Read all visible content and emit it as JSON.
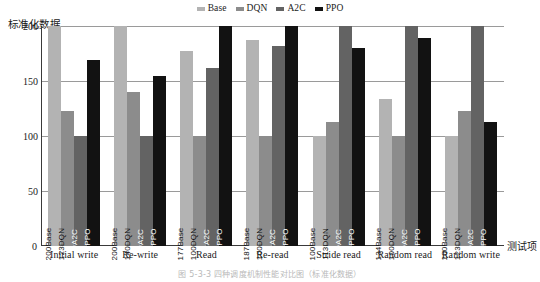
{
  "chart_data": {
    "type": "bar",
    "title": "",
    "xlabel": "测试项",
    "ylabel": "标准化数据",
    "ylim": [
      0,
      200
    ],
    "yticks": [
      0,
      50,
      100,
      150,
      200
    ],
    "grid": true,
    "legend_position": "top-center",
    "categories": [
      "Initial write",
      "Re-write",
      "Read",
      "Re-read",
      "Stride read",
      "Random read",
      "Random write"
    ],
    "series": [
      {
        "name": "Base",
        "color": "#b3b3b3",
        "values": [
          200,
          200,
          177,
          187,
          100,
          134,
          100
        ]
      },
      {
        "name": "DQN",
        "color": "#8c8c8c",
        "values": [
          123,
          140,
          100,
          100,
          113,
          100,
          123
        ]
      },
      {
        "name": "A2C",
        "color": "#636363",
        "values": [
          100,
          100,
          162,
          182,
          200,
          200,
          200
        ]
      },
      {
        "name": "PPO",
        "color": "#121212",
        "values": [
          169,
          155,
          200,
          200,
          180,
          189,
          113
        ]
      }
    ],
    "bar_labels": [
      [
        "200Base",
        "123DQN",
        "100A2C",
        "169PPO"
      ],
      [
        "200Base",
        "140DQN",
        "100A2C",
        "155PPO"
      ],
      [
        "177Base",
        "100DQN",
        "162A2C",
        "200PPO"
      ],
      [
        "187Base",
        "100DQN",
        "182A2C",
        "200PPO"
      ],
      [
        "100Base",
        "113DQN",
        "200A2C",
        "180PPO"
      ],
      [
        "134Base",
        "100DQN",
        "200A2C",
        "189PPO"
      ],
      [
        "100Base",
        "123DQN",
        "200A2C",
        "113PPO"
      ]
    ]
  },
  "legend": {
    "items": [
      {
        "label": "Base",
        "color": "#b3b3b3"
      },
      {
        "label": "DQN",
        "color": "#8c8c8c"
      },
      {
        "label": "A2C",
        "color": "#636363"
      },
      {
        "label": "PPO",
        "color": "#121212"
      }
    ]
  },
  "axes": {
    "y_title": "标准化数据",
    "x_title": "测试项",
    "zero": "0"
  },
  "caption": "图 5-3-3  四种调度机制性能对比图（标准化数据）"
}
